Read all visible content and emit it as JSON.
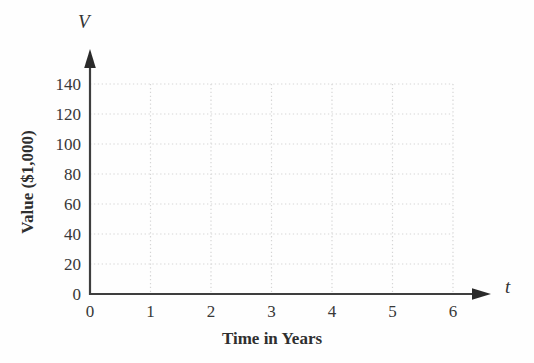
{
  "chart": {
    "y_axis_symbol": "V",
    "x_axis_symbol": "t",
    "x_title": "Time in Years",
    "y_title": "Value ($1,000)"
  },
  "chart_data": {
    "type": "line",
    "series": [],
    "title": "",
    "xlabel": "Time in Years",
    "ylabel": "Value ($1,000)",
    "x_axis_symbol": "t",
    "y_axis_symbol": "V",
    "xlim": [
      0,
      6
    ],
    "ylim": [
      0,
      140
    ],
    "x_ticks": [
      0,
      1,
      2,
      3,
      4,
      5,
      6
    ],
    "y_ticks": [
      0,
      20,
      40,
      60,
      80,
      100,
      120,
      140
    ],
    "grid": "dotted",
    "grid_extent": {
      "x_max": 6,
      "y_max": 140
    },
    "legend": "none",
    "colors": {
      "axis": "#3e3e3e",
      "arrow": "#2a2a2a",
      "grid": "#d5d5d5",
      "text": "#383838",
      "background": "#fefefe"
    }
  }
}
